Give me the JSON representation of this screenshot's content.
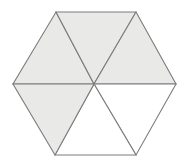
{
  "figure": {
    "name": "hexagon-divided-into-six-triangles",
    "shape": "regular-hexagon",
    "orientation": "flat-top",
    "canvas": {
      "width": 187,
      "height": 161,
      "background": "#ffffff"
    },
    "style": {
      "shaded_fill": "#e9e9e7",
      "unshaded_fill": "#ffffff",
      "stroke": "#7d7d7d",
      "stroke_width": 1.1
    },
    "center": {
      "x": 94,
      "y": 84
    },
    "vertices": [
      {
        "label": "top-left",
        "x": 56,
        "y": 12
      },
      {
        "label": "top-right",
        "x": 136,
        "y": 12
      },
      {
        "label": "right",
        "x": 176,
        "y": 84
      },
      {
        "label": "bottom-right",
        "x": 136,
        "y": 155
      },
      {
        "label": "bottom-left",
        "x": 55,
        "y": 155
      },
      {
        "label": "left",
        "x": 13,
        "y": 84
      }
    ],
    "triangles": [
      {
        "id": "top-left-triangle",
        "shaded": true,
        "fill": "#e9e9e7",
        "points": "56,12 94,84 13,84"
      },
      {
        "id": "top-center-triangle",
        "shaded": true,
        "fill": "#e9e9e7",
        "points": "56,12 136,12 94,84"
      },
      {
        "id": "top-right-triangle",
        "shaded": true,
        "fill": "#e9e9e7",
        "points": "136,12 176,84 94,84"
      },
      {
        "id": "bottom-right-triangle",
        "shaded": false,
        "fill": "#ffffff",
        "points": "176,84 136,155 94,84"
      },
      {
        "id": "bottom-center-triangle",
        "shaded": false,
        "fill": "#ffffff",
        "points": "136,155 55,155 94,84"
      },
      {
        "id": "bottom-left-triangle",
        "shaded": true,
        "fill": "#e9e9e7",
        "points": "55,155 13,84 94,84"
      }
    ],
    "counts": {
      "total_triangles": 6,
      "shaded_triangles": 4,
      "unshaded_triangles": 2
    }
  }
}
